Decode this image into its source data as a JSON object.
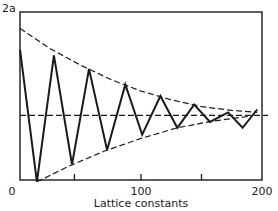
{
  "chart_data": {
    "type": "line",
    "title": "",
    "xlabel": "Lattice constants",
    "ylabel": "",
    "y_top_label": "2a",
    "xlim": [
      0,
      200
    ],
    "ylim": [
      0,
      2
    ],
    "x_tick_labels": [
      "0",
      "100",
      "200"
    ],
    "x_minor_ticks": [
      45,
      150
    ],
    "grid": false,
    "legend": null,
    "series": [
      {
        "name": "oscillation",
        "style": "solid",
        "x": [
          0,
          14,
          28,
          43,
          57,
          72,
          87,
          101,
          116,
          130,
          144,
          157,
          172,
          184,
          196
        ],
        "y": [
          1.61,
          0.24,
          1.55,
          0.42,
          1.41,
          0.57,
          1.25,
          0.73,
          1.13,
          0.8,
          1.04,
          0.86,
          0.96,
          0.8,
          0.99
        ]
      },
      {
        "name": "upper envelope",
        "style": "dashed",
        "x": [
          0,
          25,
          50,
          75,
          100,
          125,
          150,
          175,
          196
        ],
        "y": [
          1.83,
          1.62,
          1.45,
          1.3,
          1.18,
          1.09,
          1.02,
          0.98,
          0.96
        ]
      },
      {
        "name": "lower envelope",
        "style": "dashed",
        "x": [
          14,
          40,
          70,
          100,
          130,
          160,
          190
        ],
        "y": [
          0.24,
          0.4,
          0.56,
          0.69,
          0.8,
          0.87,
          0.92
        ]
      },
      {
        "name": "mean level a",
        "style": "dashed",
        "x": [
          0,
          205
        ],
        "y": [
          0.93,
          0.93
        ]
      }
    ]
  },
  "labels": {
    "y_top": "2a",
    "x_0": "0",
    "x_100": "100",
    "x_200": "200",
    "x_axis": "Lattice constants"
  },
  "colors": {
    "line": "#1a1a1a",
    "background": "#ffffff"
  }
}
